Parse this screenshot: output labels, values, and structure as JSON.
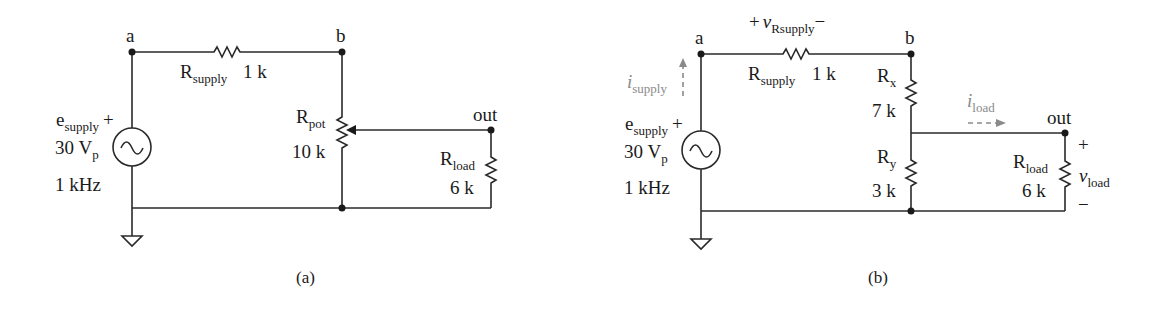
{
  "figure_a": {
    "caption": "(a)",
    "nodes": {
      "a": "a",
      "b": "b",
      "out": "out"
    },
    "source": {
      "name_main": "e",
      "name_sub": "supply",
      "polarity": "+",
      "amp_main": "30 V",
      "amp_sub": "p",
      "freq": "1 kHz"
    },
    "r_supply": {
      "name_main": "R",
      "name_sub": "supply",
      "value": "1 k"
    },
    "r_pot": {
      "name_main": "R",
      "name_sub": "pot",
      "value": "10 k"
    },
    "r_load": {
      "name_main": "R",
      "name_sub": "load",
      "value": "6 k"
    }
  },
  "figure_b": {
    "caption": "(b)",
    "nodes": {
      "a": "a",
      "b": "b",
      "out": "out"
    },
    "source": {
      "name_main": "e",
      "name_sub": "supply",
      "polarity": "+",
      "amp_main": "30 V",
      "amp_sub": "p",
      "freq": "1 kHz"
    },
    "i_supply": {
      "main": "i",
      "sub": "supply"
    },
    "v_rsupply": {
      "plus": "+",
      "main": "v",
      "sub": "Rsupply",
      "minus": "−"
    },
    "r_supply": {
      "name_main": "R",
      "name_sub": "supply",
      "value": "1 k"
    },
    "r_x": {
      "name_main": "R",
      "name_sub": "x",
      "value": "7 k"
    },
    "r_y": {
      "name_main": "R",
      "name_sub": "y",
      "value": "3 k"
    },
    "i_load": {
      "main": "i",
      "sub": "load"
    },
    "r_load": {
      "name_main": "R",
      "name_sub": "load",
      "value": "6 k"
    },
    "v_load": {
      "plus": "+",
      "main": "v",
      "sub": "load",
      "minus": "−"
    }
  }
}
